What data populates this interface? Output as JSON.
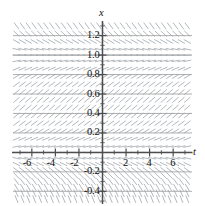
{
  "figure": {
    "type": "slope-field",
    "background_color": "#ffffff"
  },
  "axes": {
    "x_axis_label": "t",
    "y_axis_label": "x",
    "axis_color": "#4d4d4d",
    "grid_color": "#9a9a9a",
    "segment_color": "#9aa0a6"
  },
  "ticks": {
    "t_labels": [
      "-6",
      "-4",
      "-2",
      "2",
      "4",
      "6"
    ],
    "t_values": [
      -6,
      -4,
      -2,
      2,
      4,
      6
    ],
    "x_labels": [
      "1.2",
      "1.0",
      "0.8",
      "0.6",
      "0.4",
      "0.2",
      "-0.2",
      "-0.4"
    ],
    "x_values": [
      1.2,
      1.0,
      0.8,
      0.6,
      0.4,
      0.2,
      -0.2,
      -0.4
    ]
  },
  "chart_data": {
    "type": "scatter",
    "title": "",
    "xlabel": "t",
    "ylabel": "x",
    "xlim": [
      -7.6,
      7.6
    ],
    "ylim": [
      -0.52,
      1.34
    ],
    "grid": true,
    "legend": null,
    "equilibria": [
      0,
      1
    ],
    "x_grid_values": [
      -7,
      -6,
      -5,
      -4,
      -3,
      -2,
      -1,
      0,
      1,
      2,
      3,
      4,
      5,
      6,
      7
    ],
    "y_grid_values": [
      -0.4,
      -0.2,
      0.2,
      0.4,
      0.6,
      0.8,
      1.0,
      1.2
    ],
    "field": {
      "formula": "dx/dt = x*(1-x)",
      "t_samples": [
        -7.3,
        -6.8,
        -6.3,
        -5.8,
        -5.3,
        -4.8,
        -4.3,
        -3.8,
        -3.3,
        -2.8,
        -2.3,
        -1.8,
        -1.3,
        -0.8,
        -0.3,
        0.2,
        0.7,
        1.2,
        1.7,
        2.2,
        2.7,
        3.2,
        3.7,
        4.2,
        4.7,
        5.2,
        5.7,
        6.2,
        6.7,
        7.2
      ],
      "x_samples": [
        -0.48,
        -0.42,
        -0.36,
        -0.3,
        -0.24,
        -0.18,
        -0.12,
        -0.06,
        0.0,
        0.06,
        0.14,
        0.22,
        0.3,
        0.38,
        0.46,
        0.54,
        0.62,
        0.7,
        0.78,
        0.86,
        0.94,
        1.0,
        1.06,
        1.14,
        1.22,
        1.3
      ],
      "slope_rule": "slope = x*(1-x) scaled for display"
    }
  }
}
